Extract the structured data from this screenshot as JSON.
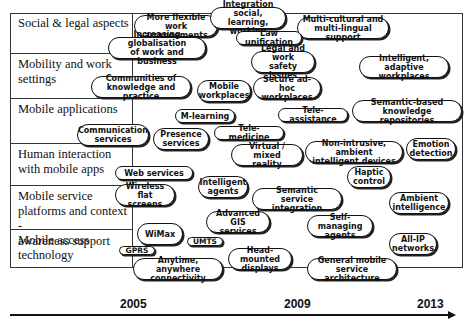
{
  "rows": [
    {
      "label": "Social & legal aspects"
    },
    {
      "label": "Mobility and work\nsettings"
    },
    {
      "label": "Mobile applications"
    },
    {
      "label": "Human interaction\nwith mobile apps"
    },
    {
      "label": "Mobile service\nplatforms and context -\nawareness support"
    },
    {
      "label": "Mobile access\ntechnology"
    }
  ],
  "pills": {
    "more_flexible": "More flexible\nwork arrangements",
    "integration_social": "Integration social,\nlearning, working",
    "multicultural": "Multi-cultural and\nmulti-lingual support",
    "increasing_globalisation": "Increasing globalisation\nof work and business",
    "law_unification": "Law unification",
    "legal_safety": "Legal and work\nsafety issues",
    "intelligent_adaptive": "Intelligent, adaptive\nworkplaces",
    "communities": "Communities of\nknowledge and practice",
    "mobile_workplaces": "Mobile\nworkplaces",
    "secure_adhoc": "Secure ad-hoc\nworkplaces",
    "semantic_repos": "Semantic-based\nknowledge repositories",
    "m_learning": "M-learning",
    "tele_assistance": "Tele-assistance",
    "communication_services": "Communication\nservices",
    "presence_services": "Presence\nservices",
    "tele_medicine": "Tele-medicine",
    "virtual_mixed": "Virtual / mixed\nreality",
    "non_intrusive": "Non-intrusive, ambient\nintelligent devices",
    "emotion_detection": "Emotion\ndetection",
    "web_services": "Web services",
    "haptic_control": "Haptic\ncontrol",
    "wireless_flat": "Wireless\nflat screens",
    "intelligent_agents": "Intelligent\nagents",
    "semantic_integration": "Semantic\nservice integration",
    "ambient_intelligence": "Ambient\nintelligence",
    "advanced_gis": "Advanced GIS\nservices",
    "self_managing": "Self-managing\nagents",
    "wimax": "WiMax",
    "umts": "UMTS",
    "all_ip": "All-IP\nnetworks",
    "gprs": "GPRS",
    "head_mounted": "Head-mounted\ndisplays",
    "anytime_anywhere": "Anytime, anywhere\nconnectivity",
    "general_mobile": "General mobile\nservice architecture"
  },
  "timeline": {
    "years": [
      "2005",
      "2009",
      "2013"
    ]
  }
}
